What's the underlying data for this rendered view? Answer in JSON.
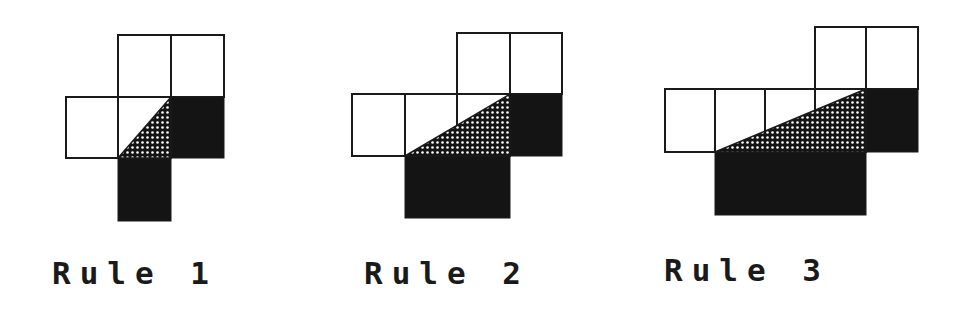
{
  "diagrams": [
    {
      "label": "Rule 1",
      "white_cells": [
        [
          118,
          35,
          53,
          62
        ],
        [
          171,
          35,
          53,
          62
        ],
        [
          66,
          97,
          52,
          61
        ],
        [
          118,
          97,
          53,
          61
        ]
      ],
      "black_cells": [
        [
          171,
          97,
          53,
          61
        ],
        [
          118,
          158,
          53,
          63
        ]
      ],
      "triangle": [
        [
          118,
          158
        ],
        [
          171,
          97
        ],
        [
          171,
          158
        ]
      ],
      "label_pos": [
        52,
        258
      ]
    },
    {
      "label": "Rule 2",
      "white_cells": [
        [
          457,
          33,
          53,
          61
        ],
        [
          510,
          33,
          52,
          61
        ],
        [
          352,
          94,
          53,
          62
        ],
        [
          405,
          94,
          52,
          62
        ],
        [
          457,
          94,
          53,
          62
        ]
      ],
      "black_cells": [
        [
          510,
          94,
          52,
          62
        ],
        [
          405,
          156,
          105,
          62
        ]
      ],
      "triangle": [
        [
          405,
          156
        ],
        [
          510,
          94
        ],
        [
          510,
          156
        ]
      ],
      "label_pos": [
        364,
        258
      ]
    },
    {
      "label": "Rule 3",
      "white_cells": [
        [
          815,
          27,
          51,
          62
        ],
        [
          866,
          27,
          52,
          62
        ],
        [
          665,
          89,
          50,
          63
        ],
        [
          715,
          89,
          50,
          63
        ],
        [
          765,
          89,
          50,
          63
        ],
        [
          815,
          89,
          51,
          63
        ]
      ],
      "black_cells": [
        [
          866,
          89,
          52,
          63
        ],
        [
          715,
          152,
          151,
          63
        ]
      ],
      "triangle": [
        [
          715,
          152
        ],
        [
          866,
          89
        ],
        [
          866,
          152
        ]
      ],
      "label_pos": [
        664,
        255
      ]
    }
  ],
  "colors": {
    "stroke": "#1a1a1a",
    "fill_black": "#141414",
    "background": "#ffffff"
  }
}
